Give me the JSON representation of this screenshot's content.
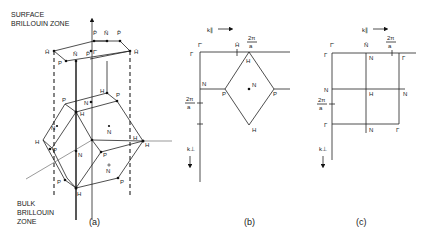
{
  "panel_a": {
    "title_surface_1": "SURFACE",
    "title_surface_2": "BRILLOUIN ZONE",
    "title_bulk_1": "BULK",
    "title_bulk_2": "BRILLOUIN",
    "title_bulk_3": "ZONE",
    "caption": "(a)",
    "surface_labels": {
      "p_bar_left": "P̄",
      "n_bar_top": "N̄",
      "p_bar_right": "P̄",
      "h_bar_left": "H̄",
      "h_bar_right": "H̄",
      "p_bar_front": "P̄",
      "n_bar_front": "N̄",
      "p_gamma": "P̄",
      "gamma_bar": "Γ̄",
      "p_front_left": "P"
    },
    "bulk_labels": {
      "h_back": "H",
      "p_back_right": "P",
      "p_back_left": "P",
      "n_back": "N",
      "h_top": "H",
      "n_left": "N",
      "n_right": "N",
      "h_left": "H",
      "p_left_mid": "P",
      "n_center": "N",
      "h_right_a": "H",
      "h_right_b": "H",
      "p_right_mid": "P",
      "n_lower": "N",
      "p_lower_left": "P",
      "p_lower_right": "P",
      "h_bottom": "H"
    }
  },
  "panel_b": {
    "caption": "(b)",
    "k_par": "k∥",
    "k_perp": "k⊥",
    "gamma_bar": "Γ̄",
    "h_bar": "H̄",
    "two_pi_num": "2π",
    "two_pi_den": "a",
    "gamma": "Γ",
    "n_left": "N",
    "p_left": "P",
    "n_center": "N",
    "p_right": "P",
    "h_top": "H",
    "h_bottom": "H"
  },
  "panel_c": {
    "caption": "(c)",
    "k_par": "k∥",
    "k_perp": "k⊥",
    "gamma_bar": "Γ̄",
    "n_bar": "N̄",
    "two_pi_num": "2π",
    "two_pi_den": "a",
    "gamma_tl": "Γ",
    "n_top": "N",
    "gamma_tr": "Γ",
    "n_left": "N",
    "h_center": "H",
    "n_right": "N",
    "gamma_bl": "Γ",
    "n_bottom": "N",
    "gamma_br": "Γ"
  }
}
